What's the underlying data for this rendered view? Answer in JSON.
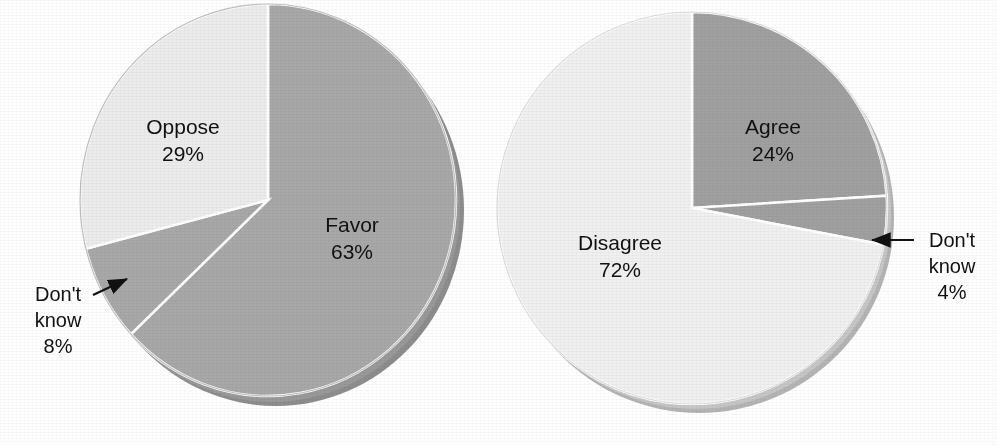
{
  "figure": {
    "background_color": "#ffffff",
    "text_color": "#111111"
  },
  "chart_data": [
    {
      "type": "pie",
      "name": "favor-oppose-pie",
      "title": "",
      "position": "left",
      "center": [
        268,
        200
      ],
      "radius": 188,
      "depth_3d": 14,
      "start_angle_deg": 0,
      "direction": "clockwise",
      "labels": [
        "Favor",
        "Don't know",
        "Oppose"
      ],
      "values": [
        63,
        8,
        29
      ],
      "value_labels": [
        "63%",
        "8%",
        "29%"
      ],
      "colors": [
        "#a8a8a8",
        "#a8a8a8",
        "#ececec"
      ],
      "slices": [
        {
          "label": "Favor",
          "value": 63,
          "value_label": "63%",
          "color": "#a8a8a8",
          "label_placement": "inside",
          "label_x": 352,
          "label_y": 232
        },
        {
          "label": "Don't know",
          "value": 8,
          "value_label": "8%",
          "color": "#a8a8a8",
          "label_placement": "callout",
          "label_line1": "Don't",
          "label_line2": "know",
          "label_x": 60,
          "label_y": 301,
          "arrow_from": [
            93,
            295
          ],
          "arrow_to": [
            126,
            280
          ]
        },
        {
          "label": "Oppose",
          "value": 29,
          "value_label": "29%",
          "color": "#ececec",
          "label_placement": "inside",
          "label_x": 183,
          "label_y": 134
        }
      ]
    },
    {
      "type": "pie",
      "name": "agree-disagree-pie",
      "title": "",
      "position": "right",
      "center": [
        692,
        208
      ],
      "radius": 195,
      "depth_3d": 14,
      "start_angle_deg": 0,
      "direction": "clockwise",
      "labels": [
        "Agree",
        "Don't know",
        "Disagree"
      ],
      "values": [
        24,
        4,
        72
      ],
      "value_labels": [
        "24%",
        "4%",
        "72%"
      ],
      "colors": [
        "#a0a0a0",
        "#a0a0a0",
        "#f0f0f0"
      ],
      "slices": [
        {
          "label": "Agree",
          "value": 24,
          "value_label": "24%",
          "color": "#a0a0a0",
          "label_placement": "inside",
          "label_x": 773,
          "label_y": 134
        },
        {
          "label": "Don't know",
          "value": 4,
          "value_label": "4%",
          "color": "#a0a0a0",
          "label_placement": "callout",
          "label_line1": "Don't",
          "label_line2": "know",
          "label_x": 952,
          "label_y": 247,
          "arrow_from": [
            913,
            240
          ],
          "arrow_to": [
            873,
            240
          ]
        },
        {
          "label": "Disagree",
          "value": 72,
          "value_label": "72%",
          "color": "#f0f0f0",
          "label_placement": "inside",
          "label_x": 620,
          "label_y": 250
        }
      ]
    }
  ],
  "left_chart": {
    "favor_label": "Favor",
    "favor_value": "63%",
    "oppose_label": "Oppose",
    "oppose_value": "29%",
    "dk_line1": "Don't",
    "dk_line2": "know",
    "dk_value": "8%"
  },
  "right_chart": {
    "agree_label": "Agree",
    "agree_value": "24%",
    "disagree_label": "Disagree",
    "disagree_value": "72%",
    "dk_line1": "Don't",
    "dk_line2": "know",
    "dk_value": "4%"
  }
}
